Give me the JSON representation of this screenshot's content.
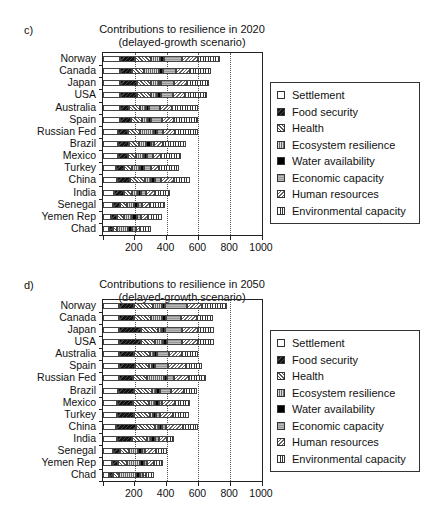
{
  "chart_data": [
    {
      "panel": "c)",
      "type": "bar",
      "orientation": "horizontal",
      "stacked": true,
      "title": "Contributions to resilience in 2020",
      "subtitle": "(delayed-growth scenario)",
      "xlabel": "",
      "ylabel": "",
      "xlim": [
        0,
        1000
      ],
      "xticks": [
        200,
        400,
        600,
        800,
        1000
      ],
      "grid": "dotted vertical at 200, 400, 600, 800",
      "legend_position": "right",
      "categories": [
        "Norway",
        "Canada",
        "Japan",
        "USA",
        "Australia",
        "Spain",
        "Russian Fed",
        "Brazil",
        "Mexico",
        "Turkey",
        "China",
        "India",
        "Senegal",
        "Yemen Rep",
        "Chad"
      ],
      "series": [
        {
          "name": "Settlement",
          "pattern": "white",
          "values": [
            105,
            105,
            105,
            105,
            105,
            105,
            95,
            95,
            95,
            80,
            85,
            70,
            60,
            50,
            40
          ]
        },
        {
          "name": "Food security",
          "pattern": "black-hatched",
          "values": [
            95,
            75,
            110,
            110,
            60,
            70,
            65,
            70,
            60,
            50,
            85,
            60,
            45,
            40,
            25
          ]
        },
        {
          "name": "Health",
          "pattern": "diagonal-hatch",
          "values": [
            105,
            80,
            85,
            85,
            65,
            70,
            70,
            60,
            55,
            55,
            95,
            50,
            45,
            40,
            20
          ]
        },
        {
          "name": "Ecosystem resilience",
          "pattern": "dotted",
          "values": [
            55,
            90,
            50,
            40,
            40,
            35,
            90,
            45,
            45,
            50,
            35,
            40,
            45,
            55,
            75
          ]
        },
        {
          "name": "Water availability",
          "pattern": "solid-black",
          "values": [
            25,
            25,
            15,
            25,
            20,
            20,
            20,
            30,
            20,
            25,
            25,
            20,
            25,
            30,
            25
          ]
        },
        {
          "name": "Economic capacity",
          "pattern": "grey-horizontal",
          "values": [
            115,
            85,
            80,
            75,
            70,
            70,
            40,
            20,
            40,
            40,
            40,
            30,
            25,
            25,
            20
          ]
        },
        {
          "name": "Human resources",
          "pattern": "diagonal-light",
          "values": [
            100,
            85,
            85,
            75,
            75,
            75,
            75,
            55,
            50,
            55,
            80,
            60,
            50,
            45,
            30
          ]
        },
        {
          "name": "Environmental capacity",
          "pattern": "vertical-lines",
          "values": [
            135,
            135,
            135,
            140,
            165,
            155,
            145,
            145,
            125,
            125,
            100,
            90,
            95,
            85,
            65
          ]
        }
      ],
      "totals_approx": [
        735,
        680,
        665,
        655,
        600,
        600,
        600,
        520,
        490,
        480,
        545,
        420,
        390,
        370,
        300
      ]
    },
    {
      "panel": "d)",
      "type": "bar",
      "orientation": "horizontal",
      "stacked": true,
      "title": "Contributions to resilience in 2050",
      "subtitle": "(delayed-growth scenario)",
      "xlabel": "",
      "ylabel": "",
      "xlim": [
        0,
        1000
      ],
      "xticks": [
        200,
        400,
        600,
        800,
        1000
      ],
      "grid": "dotted vertical at 200, 400, 600, 800",
      "legend_position": "right",
      "categories": [
        "Norway",
        "Canada",
        "Japan",
        "USA",
        "Australia",
        "Spain",
        "Russian Fed",
        "Brazil",
        "Mexico",
        "Turkey",
        "China",
        "India",
        "Senegal",
        "Yemen Rep",
        "Chad"
      ],
      "series": [
        {
          "name": "Settlement",
          "pattern": "white",
          "values": [
            100,
            100,
            100,
            100,
            100,
            100,
            100,
            95,
            90,
            90,
            80,
            90,
            60,
            55,
            40
          ]
        },
        {
          "name": "Food security",
          "pattern": "black-hatched",
          "values": [
            95,
            95,
            140,
            140,
            95,
            100,
            90,
            100,
            100,
            105,
            130,
            95,
            45,
            40,
            25
          ]
        },
        {
          "name": "Health",
          "pattern": "diagonal-hatch",
          "values": [
            120,
            110,
            105,
            90,
            100,
            90,
            85,
            115,
            100,
            100,
            120,
            90,
            60,
            55,
            35
          ]
        },
        {
          "name": "Ecosystem resilience",
          "pattern": "dotted",
          "values": [
            55,
            65,
            25,
            50,
            25,
            20,
            110,
            25,
            35,
            20,
            20,
            30,
            55,
            80,
            110
          ]
        },
        {
          "name": "Water availability",
          "pattern": "solid-black",
          "values": [
            20,
            25,
            20,
            25,
            20,
            20,
            20,
            25,
            25,
            20,
            20,
            25,
            25,
            25,
            25
          ]
        },
        {
          "name": "Economic capacity",
          "pattern": "grey-horizontal",
          "values": [
            140,
            95,
            110,
            95,
            75,
            80,
            40,
            70,
            20,
            25,
            25,
            20,
            20,
            20,
            15
          ]
        },
        {
          "name": "Human resources",
          "pattern": "diagonal-light",
          "values": [
            90,
            100,
            100,
            100,
            85,
            110,
            95,
            80,
            85,
            80,
            110,
            50,
            70,
            45,
            20
          ]
        },
        {
          "name": "Environmental capacity",
          "pattern": "vertical-lines",
          "values": [
            160,
            100,
            100,
            100,
            100,
            100,
            110,
            80,
            95,
            100,
            95,
            50,
            65,
            60,
            50
          ]
        }
      ],
      "totals_approx": [
        780,
        690,
        700,
        700,
        600,
        620,
        650,
        590,
        550,
        540,
        600,
        450,
        400,
        380,
        320
      ]
    }
  ],
  "panels": {
    "c": {
      "letter": "c)",
      "title": "Contributions to resilience in 2020",
      "subtitle": "(delayed-growth scenario)"
    },
    "d": {
      "letter": "d)",
      "title": "Contributions to resilience in 2050",
      "subtitle": "(delayed-growth scenario)"
    }
  },
  "axis": {
    "ticks": [
      "200",
      "400",
      "600",
      "800",
      "1000"
    ]
  },
  "legend": [
    {
      "label": "Settlement",
      "cls": "p-settlement"
    },
    {
      "label": "Food security",
      "cls": "p-food"
    },
    {
      "label": "Health",
      "cls": "p-health"
    },
    {
      "label": "Ecosystem resilience",
      "cls": "p-eco"
    },
    {
      "label": "Water availability",
      "cls": "p-water"
    },
    {
      "label": "Economic capacity",
      "cls": "p-econ"
    },
    {
      "label": "Human resources",
      "cls": "p-human"
    },
    {
      "label": "Environmental capacity",
      "cls": "p-env"
    }
  ]
}
